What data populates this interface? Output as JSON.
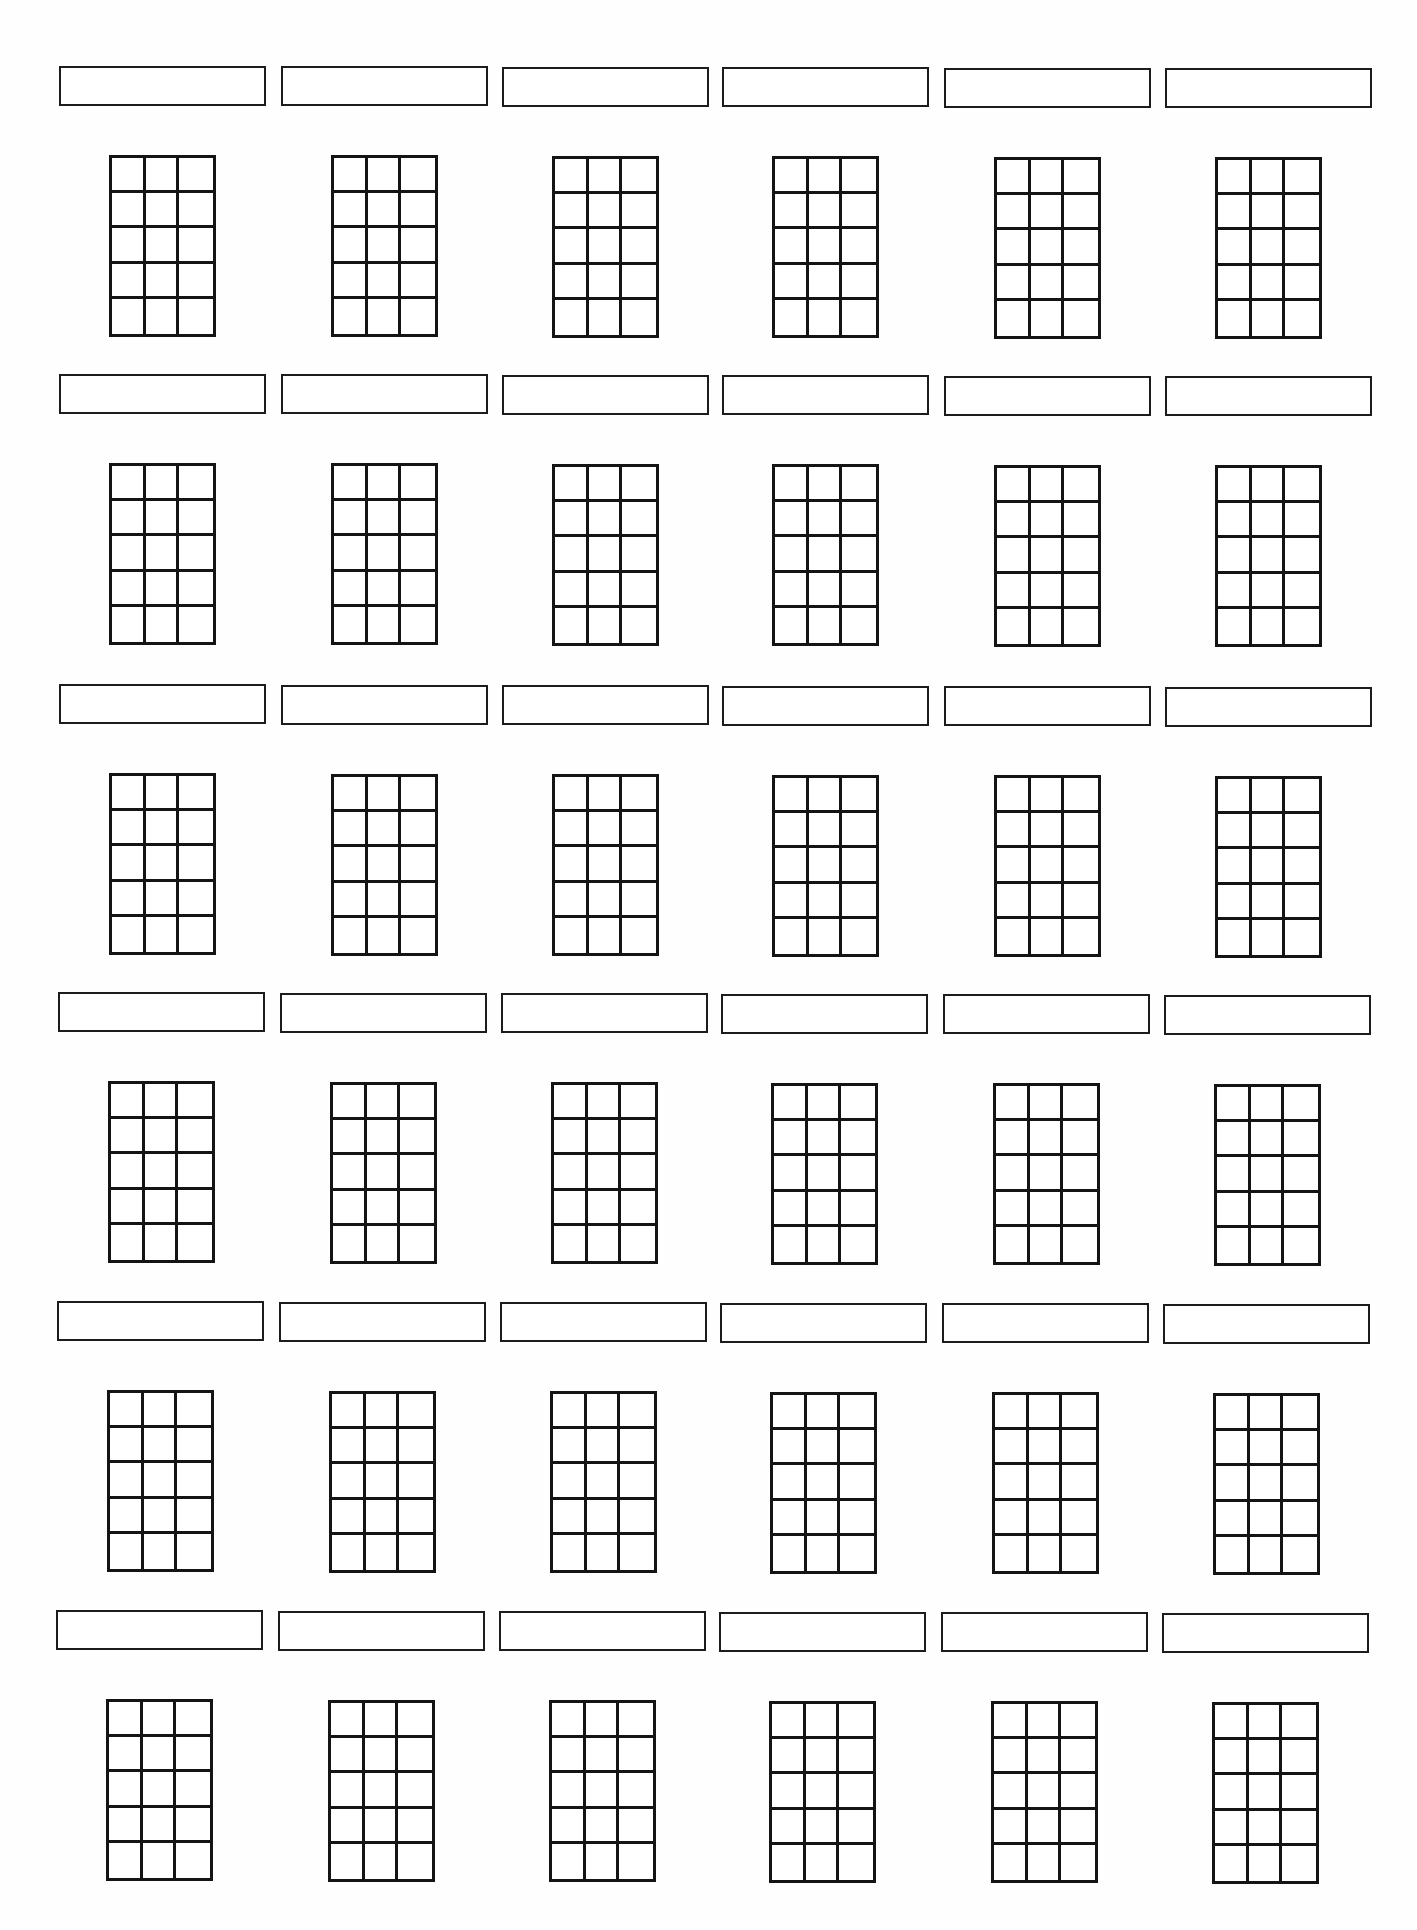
{
  "worksheet": {
    "type": "blank chord diagram worksheet",
    "rows": 6,
    "columns": 6,
    "diagram": {
      "strings": 4,
      "frets": 5,
      "cell_columns": 3,
      "cell_rows": 5
    },
    "colors": {
      "line": "#141414",
      "box_border": "#1c1c1c",
      "background": "#ffffff"
    },
    "chord_names": [
      [
        "",
        "",
        "",
        "",
        "",
        ""
      ],
      [
        "",
        "",
        "",
        "",
        "",
        ""
      ],
      [
        "",
        "",
        "",
        "",
        "",
        ""
      ],
      [
        "",
        "",
        "",
        "",
        "",
        ""
      ],
      [
        "",
        "",
        "",
        "",
        "",
        ""
      ],
      [
        "",
        "",
        "",
        "",
        "",
        ""
      ]
    ],
    "layout": {
      "column_left": [
        59,
        281,
        502,
        722,
        944,
        1165
      ],
      "row_top": [
        66,
        374,
        684,
        992,
        1301,
        1610
      ],
      "row_x_shift": [
        0,
        0,
        0,
        -1,
        -2,
        -3
      ],
      "row_y_skew_per_col": [
        0.4,
        0.4,
        0.5,
        0.5,
        0.6,
        0.6
      ],
      "grid_offset_x": 50,
      "grid_offset_y": 89
    }
  },
  "footer": {
    "page_number_cropped": true
  }
}
